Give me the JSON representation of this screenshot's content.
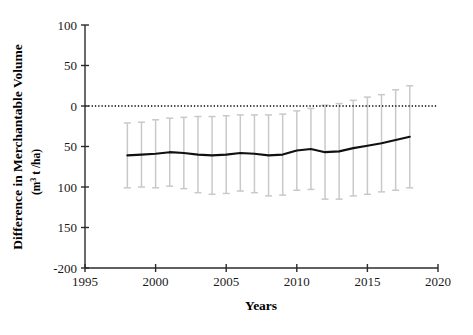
{
  "chart_data": {
    "type": "line",
    "title": "",
    "xlabel": "Years",
    "ylabel": "Difference in Merchantable Volume",
    "ylabel_units": "(m3 t /ha)",
    "ylabel_units_base": "(m",
    "ylabel_units_exp": "3",
    "ylabel_units_tail": " t /ha)",
    "xlim": [
      1995,
      2020
    ],
    "ylim": [
      -200,
      100
    ],
    "xticks": [
      1995,
      2000,
      2005,
      2010,
      2015,
      2020
    ],
    "xtick_labels": [
      "1995",
      "2000",
      "2005",
      "2010",
      "2015",
      "2020"
    ],
    "yticks": [
      100,
      50,
      0,
      -50,
      -100,
      -150,
      -200
    ],
    "ytick_labels": [
      "100",
      "50",
      "0",
      "50",
      "100",
      "150",
      "-200"
    ],
    "grid": false,
    "legend": false,
    "zero_reference_line": {
      "value": 0,
      "style": "dotted",
      "color": "#000000"
    },
    "x": [
      1998,
      1999,
      2000,
      2001,
      2002,
      2003,
      2004,
      2005,
      2006,
      2007,
      2008,
      2009,
      2010,
      2011,
      2012,
      2013,
      2014,
      2015,
      2016,
      2017,
      2018
    ],
    "values": [
      -61,
      -60,
      -59,
      -57,
      -58,
      -60,
      -61,
      -60,
      -58,
      -59,
      -61,
      -60,
      -55,
      -53,
      -57,
      -56,
      -52,
      -49,
      -46,
      -42,
      -38
    ],
    "err_upper": [
      -21,
      -20,
      -17,
      -15,
      -14,
      -13,
      -13,
      -12,
      -11,
      -11,
      -11,
      -10,
      -6,
      -3,
      1,
      3,
      7,
      11,
      14,
      20,
      25
    ],
    "err_lower": [
      -101,
      -100,
      -101,
      -99,
      -102,
      -107,
      -109,
      -108,
      -105,
      -107,
      -111,
      -110,
      -104,
      -103,
      -115,
      -115,
      -111,
      -109,
      -106,
      -104,
      -101
    ],
    "series": [
      {
        "name": "Difference in Merchantable Volume",
        "color": "#111111"
      }
    ],
    "errorbar_color": "#c9c9c9",
    "line_color": "#111111",
    "line_width": 2.1
  }
}
